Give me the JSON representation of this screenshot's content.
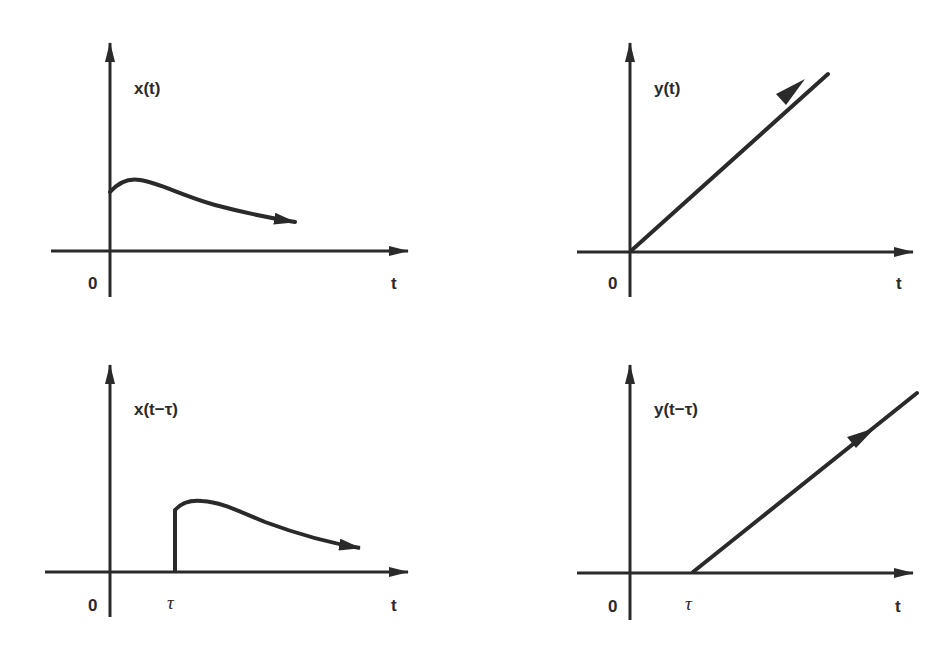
{
  "figure": {
    "colors": {
      "ink": "#2a2a2a",
      "background": "#ffffff"
    },
    "panels": [
      {
        "id": "x-t",
        "ylabel": "x(t)",
        "xlabel": "t",
        "origin_label": "0",
        "shift_label": "",
        "curve": "pulse-decay starting at t=0, rises slightly then decays"
      },
      {
        "id": "y-t",
        "ylabel": "y(t)",
        "xlabel": "t",
        "origin_label": "0",
        "shift_label": "",
        "curve": "ramp starting at origin"
      },
      {
        "id": "x-t-tau",
        "ylabel": "x(t−τ)",
        "xlabel": "t",
        "origin_label": "0",
        "shift_label": "τ",
        "curve": "same pulse-decay shifted right by τ, step at t=τ"
      },
      {
        "id": "y-t-tau",
        "ylabel": "y(t−τ)",
        "xlabel": "t",
        "origin_label": "0",
        "shift_label": "τ",
        "curve": "ramp starting at t=τ"
      }
    ]
  }
}
